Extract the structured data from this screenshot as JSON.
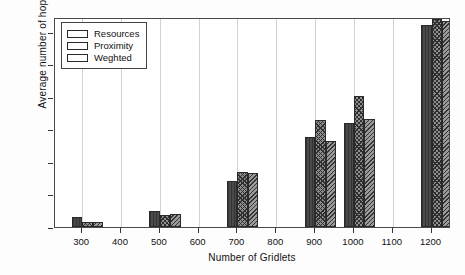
{
  "chart_data": {
    "type": "bar",
    "title": "",
    "xlabel": "Number of Gridlets",
    "ylabel": "Average number of hops",
    "categories": [
      "300",
      "500",
      "700",
      "900",
      "1000",
      "1200"
    ],
    "series": [
      {
        "name": "Resources",
        "values": [
          3.0,
          5.0,
          14.0,
          27.7,
          32.0,
          62.0
        ]
      },
      {
        "name": "Proximity",
        "values": [
          1.5,
          3.8,
          17.0,
          32.8,
          40.3,
          64.0
        ]
      },
      {
        "name": "Weghted",
        "values": [
          1.5,
          3.9,
          16.5,
          26.3,
          33.3,
          63.4
        ]
      }
    ],
    "xlim": [
      230,
      1250
    ],
    "ylim": [
      0,
      64.5
    ],
    "yticks": [
      0,
      10,
      20,
      30,
      40,
      50,
      60
    ],
    "xticks": [
      300,
      400,
      500,
      600,
      700,
      800,
      900,
      1000,
      1100,
      1200
    ],
    "grid": "vertical",
    "legend_position": "upper-left"
  },
  "legend": {
    "entries": [
      {
        "label": "Resources",
        "pattern": "solid-dark"
      },
      {
        "label": "Proximity",
        "pattern": "cross-hatch"
      },
      {
        "label": "Weghted",
        "pattern": "diagonal-hatch"
      }
    ]
  }
}
